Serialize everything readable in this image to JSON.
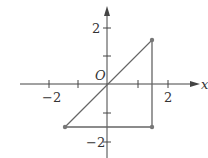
{
  "diagram": {
    "axes": {
      "x_label": "x",
      "origin_label": "O",
      "x_ticks": [
        {
          "value": -2,
          "label": "−2"
        },
        {
          "value": -1,
          "label": ""
        },
        {
          "value": 1,
          "label": ""
        },
        {
          "value": 2,
          "label": "2"
        }
      ],
      "y_ticks": [
        {
          "value": 2,
          "label": "2"
        },
        {
          "value": 1,
          "label": ""
        },
        {
          "value": -1,
          "label": ""
        },
        {
          "value": -2,
          "label": "−2"
        }
      ]
    },
    "points": [
      {
        "x": 1.5,
        "y": 1.5
      },
      {
        "x": -1.5,
        "y": -1.5
      },
      {
        "x": 1.5,
        "y": -1.5
      }
    ],
    "colors": {
      "axis": "#444444",
      "shape": "#666666",
      "point": "#777777"
    }
  }
}
